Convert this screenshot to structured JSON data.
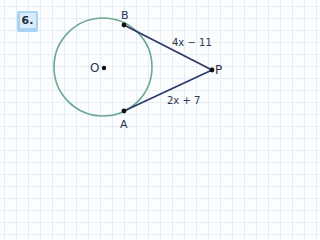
{
  "problem": {
    "number": "6.",
    "badge_color": "#a9d3f0"
  },
  "figure": {
    "circle": {
      "center_label": "O",
      "stroke": "#6aa894"
    },
    "points": {
      "B": "B",
      "A": "A",
      "P": "P"
    },
    "segments": {
      "BP": "4x − 11",
      "AP": "2x + 7"
    },
    "segment_color": "#2e3a6a"
  }
}
